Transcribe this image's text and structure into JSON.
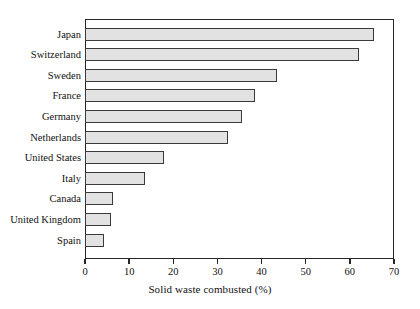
{
  "chart_data": {
    "type": "bar",
    "orientation": "horizontal",
    "title": "",
    "xlabel": "Solid waste combusted (%)",
    "ylabel": "",
    "categories": [
      "Japan",
      "Switzerland",
      "Sweden",
      "France",
      "Germany",
      "Netherlands",
      "United States",
      "Italy",
      "Canada",
      "United Kingdom",
      "Spain"
    ],
    "values": [
      65.5,
      62,
      43.5,
      38.5,
      35.5,
      32.5,
      18,
      13.5,
      6.3,
      6,
      4.2
    ],
    "xlim": [
      0,
      70
    ],
    "xticks": [
      0,
      10,
      20,
      30,
      40,
      50,
      60,
      70
    ],
    "xtick_labels": [
      "0",
      "10",
      "20",
      "30",
      "40",
      "50",
      "60",
      "70"
    ],
    "grid": false,
    "legend": false,
    "bar_fill_color": "#e2e2e2",
    "bar_border_color": "#3a3a3a",
    "frame_color": "#262626",
    "background_color": "#ffffff"
  }
}
